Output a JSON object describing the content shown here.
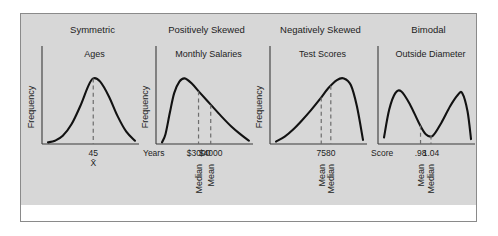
{
  "figure": {
    "background_gray": "#d7d7d7",
    "border_color": "#8a8a8a",
    "curve_color": "#121212",
    "dash_color": "#6d6d6d"
  },
  "panels": [
    {
      "title": "Symmetric",
      "subtitle": "Ages",
      "ylabel": "Frequency",
      "xlabel": "Years",
      "ticks": [
        "45"
      ],
      "stat_labels": [
        "X̄"
      ],
      "marker_orientation": "horizontal"
    },
    {
      "title": "Positively Skewed",
      "subtitle": "Monthly Salaries",
      "ylabel": "Frequency",
      "xlabel": "",
      "ticks": [
        "$3000",
        "$4000"
      ],
      "stat_labels": [
        "Median",
        "Mean"
      ],
      "marker_orientation": "vertical"
    },
    {
      "title": "Negatively Skewed",
      "subtitle": "Test Scores",
      "ylabel": "Frequency",
      "xlabel": "Score",
      "ticks": [
        "75",
        "80"
      ],
      "stat_labels": [
        "Mean",
        "Median"
      ],
      "marker_orientation": "vertical"
    },
    {
      "title": "Bimodal",
      "subtitle": "Outside Diameter",
      "ylabel": "",
      "xlabel": "cm",
      "ticks": [
        ".98",
        "1.04"
      ],
      "stat_labels": [
        "Mean",
        "Median"
      ],
      "marker_orientation": "vertical"
    }
  ],
  "chart_data": {
    "type": "line",
    "charts": [
      {
        "name": "Symmetric",
        "variable": "Ages",
        "xlabel": "Years",
        "ylabel": "Frequency",
        "shape": "symmetric bell",
        "markers": [
          {
            "label": "X̄",
            "tick": "45",
            "x_frac": 0.52
          }
        ],
        "curve_points": [
          [
            0.0,
            0.02
          ],
          [
            0.08,
            0.04
          ],
          [
            0.17,
            0.1
          ],
          [
            0.27,
            0.24
          ],
          [
            0.37,
            0.46
          ],
          [
            0.46,
            0.7
          ],
          [
            0.52,
            0.8
          ],
          [
            0.6,
            0.76
          ],
          [
            0.7,
            0.58
          ],
          [
            0.8,
            0.34
          ],
          [
            0.9,
            0.15
          ],
          [
            1.0,
            0.04
          ]
        ]
      },
      {
        "name": "Positively Skewed",
        "variable": "Monthly Salaries",
        "xlabel": "",
        "ylabel": "Frequency",
        "shape": "right-skewed, long right tail",
        "markers": [
          {
            "label": "Median",
            "tick": "$3000",
            "x_frac": 0.42
          },
          {
            "label": "Mean",
            "tick": "$4000",
            "x_frac": 0.56
          }
        ],
        "curve_points": [
          [
            0.0,
            0.02
          ],
          [
            0.04,
            0.12
          ],
          [
            0.09,
            0.38
          ],
          [
            0.14,
            0.62
          ],
          [
            0.2,
            0.76
          ],
          [
            0.26,
            0.8
          ],
          [
            0.34,
            0.74
          ],
          [
            0.44,
            0.62
          ],
          [
            0.56,
            0.48
          ],
          [
            0.68,
            0.34
          ],
          [
            0.8,
            0.21
          ],
          [
            0.9,
            0.12
          ],
          [
            1.0,
            0.04
          ]
        ]
      },
      {
        "name": "Negatively Skewed",
        "variable": "Test Scores",
        "xlabel": "Score",
        "ylabel": "Frequency",
        "shape": "left-skewed, long left tail",
        "markers": [
          {
            "label": "Mean",
            "tick": "75",
            "x_frac": 0.52
          },
          {
            "label": "Median",
            "tick": "80",
            "x_frac": 0.63
          }
        ],
        "curve_points": [
          [
            0.0,
            0.03
          ],
          [
            0.1,
            0.09
          ],
          [
            0.2,
            0.18
          ],
          [
            0.3,
            0.29
          ],
          [
            0.4,
            0.41
          ],
          [
            0.5,
            0.54
          ],
          [
            0.6,
            0.68
          ],
          [
            0.7,
            0.78
          ],
          [
            0.78,
            0.8
          ],
          [
            0.86,
            0.72
          ],
          [
            0.93,
            0.46
          ],
          [
            1.0,
            0.05
          ]
        ]
      },
      {
        "name": "Bimodal",
        "variable": "Outside Diameter",
        "xlabel": "cm",
        "ylabel": "",
        "shape": "two modes with central valley",
        "markers": [
          {
            "label": "Mean",
            "tick": ".98",
            "x_frac": 0.42
          },
          {
            "label": "Median",
            "tick": "1.04",
            "x_frac": 0.54
          }
        ],
        "curve_points": [
          [
            0.0,
            0.08
          ],
          [
            0.06,
            0.42
          ],
          [
            0.13,
            0.62
          ],
          [
            0.2,
            0.64
          ],
          [
            0.3,
            0.48
          ],
          [
            0.4,
            0.26
          ],
          [
            0.48,
            0.12
          ],
          [
            0.56,
            0.1
          ],
          [
            0.66,
            0.26
          ],
          [
            0.76,
            0.46
          ],
          [
            0.85,
            0.6
          ],
          [
            0.9,
            0.62
          ],
          [
            0.96,
            0.4
          ],
          [
            1.0,
            0.06
          ]
        ]
      }
    ]
  }
}
